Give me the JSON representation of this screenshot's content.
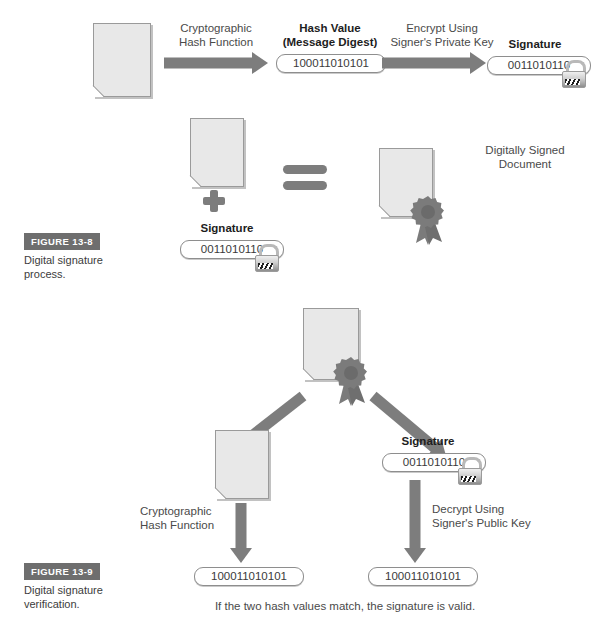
{
  "figures": [
    {
      "badge": "FIGURE 13-8",
      "caption": "Digital signature process."
    },
    {
      "badge": "FIGURE 13-9",
      "caption": "Digital signature verification."
    }
  ],
  "process": {
    "hash_function_label": "Cryptographic\nHash Function",
    "hash_function_line1": "Cryptographic",
    "hash_function_line2": "Hash Function",
    "hash_value_title_line1": "Hash Value",
    "hash_value_title_line2": "(Message Digest)",
    "hash_value": "100011010101",
    "encrypt_label_line1": "Encrypt Using",
    "encrypt_label_line2": "Signer's Private Key",
    "signature_title": "Signature",
    "signature_value": "0011010110"
  },
  "combine": {
    "signature_title": "Signature",
    "signature_value": "0011010110",
    "signed_doc_line1": "Digitally Signed",
    "signed_doc_line2": "Document",
    "plus_symbol": "+",
    "equals_symbol": "="
  },
  "verification": {
    "hash_function_line1": "Cryptographic",
    "hash_function_line2": "Hash Function",
    "signature_title": "Signature",
    "signature_value": "0011010110",
    "decrypt_label_line1": "Decrypt Using",
    "decrypt_label_line2": "Signer's Public Key",
    "computed_hash": "100011010101",
    "decrypted_hash": "100011010101",
    "conclusion": "If the two hash values match, the signature is valid."
  },
  "colors": {
    "arrow_gray": "#7d7d7d",
    "doc_fill": "#e8e8e8",
    "doc_border": "#9a9a9a",
    "badge_bg": "#6e6e6e",
    "text": "#4a4a4a",
    "seal_gray": "#7b7b7b"
  },
  "icons": {
    "document": "document-icon",
    "lock": "padlock-icon",
    "seal": "certificate-seal-icon"
  }
}
